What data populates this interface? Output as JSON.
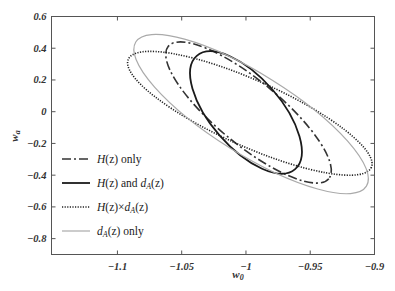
{
  "chart_data": {
    "type": "line",
    "title": "",
    "xlabel": "w0",
    "ylabel": "wa",
    "xlim": [
      -1.1513,
      -0.9
    ],
    "ylim": [
      -0.9,
      0.6
    ],
    "xticks": [
      -1.1,
      -1.05,
      -1,
      -0.95,
      -0.9
    ],
    "xtick_labels": [
      "−1.1",
      "−1.05",
      "−1",
      "−0.95",
      "−0.9"
    ],
    "yticks": [
      0.6,
      0.4,
      0.2,
      0,
      -0.2,
      -0.4,
      -0.6,
      -0.8
    ],
    "ytick_labels": [
      "0.6",
      "0.4",
      "0.2",
      "0",
      "−0.2",
      "−0.4",
      "−0.6",
      "−0.8"
    ],
    "grid": false,
    "legend_position": "lower left",
    "series": [
      {
        "name": "H(z) only",
        "style": "dash-dot",
        "color": "#333333",
        "width": 1.6,
        "center": [
          -0.998,
          -0.005
        ],
        "px_semi_major": 104,
        "px_semi_minor": 32,
        "angle_deg": 39.5
      },
      {
        "name": "H(z) and dA(z)",
        "style": "solid",
        "color": "#1a1a1a",
        "width": 1.8,
        "center": [
          -1.0,
          -0.005
        ],
        "px_semi_major": 75,
        "px_semi_minor": 35,
        "angle_deg": 49
      },
      {
        "name": "H(z) × dA(z)",
        "style": "dotted",
        "color": "#222222",
        "width": 1.6,
        "center": [
          -0.997,
          -0.01
        ],
        "px_semi_major": 133,
        "px_semi_minor": 33,
        "angle_deg": 24
      },
      {
        "name": "dA(z) only",
        "style": "solid",
        "color": "#aaaaaa",
        "width": 1.2,
        "center": [
          -0.996,
          -0.015
        ],
        "px_semi_major": 136,
        "px_semi_minor": 40,
        "angle_deg": 32
      }
    ]
  },
  "legend": {
    "items": [
      {
        "pre": "H",
        "mid": "(z) only",
        "sub": "",
        "post": ""
      },
      {
        "pre": "H",
        "mid": "(z) and ",
        "d": "d",
        "sub": "A",
        "post": "(z)"
      },
      {
        "pre": "H",
        "mid": "(z)×",
        "d": "d",
        "sub": "A",
        "post": "(z)"
      },
      {
        "pre": "",
        "mid": "",
        "d": "d",
        "sub": "A",
        "post": "(z) only"
      }
    ]
  },
  "axes": {
    "xlabel_main": "w",
    "xlabel_sub": "0",
    "ylabel_main": "w",
    "ylabel_sub": "a"
  }
}
